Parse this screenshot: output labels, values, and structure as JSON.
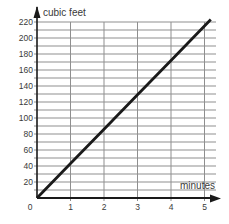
{
  "chart_data": {
    "type": "line",
    "title": "",
    "xlabel": "minutes",
    "ylabel": "cubic feet",
    "xlim": [
      0,
      5
    ],
    "ylim": [
      0,
      220
    ],
    "x_ticks": [
      0,
      1,
      2,
      3,
      4,
      5
    ],
    "y_ticks": [
      20,
      40,
      60,
      80,
      100,
      120,
      140,
      160,
      180,
      200,
      220
    ],
    "y_minor_step": 10,
    "grid": true,
    "legend": "none",
    "series": [
      {
        "name": "volume",
        "points": [
          [
            0,
            0
          ],
          [
            1,
            43
          ],
          [
            2,
            86
          ],
          [
            3,
            129
          ],
          [
            4,
            172
          ],
          [
            5,
            215
          ]
        ]
      }
    ],
    "slope_cubic_feet_per_minute": 43,
    "colors": {
      "line": "#1a1a1a",
      "axis": "#1a1a1a",
      "grid": "#8f8f8f",
      "text": "#3a3a3a",
      "background": "#ffffff"
    }
  }
}
